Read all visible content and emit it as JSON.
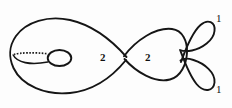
{
  "figure": {
    "kind": "mathematical-diagram",
    "stroke_color": "#151515",
    "background_color": "#ffffff",
    "components": [
      {
        "id": "left-lobe",
        "name": "left-large-loop",
        "multiplicity_label": "2",
        "has_handle": true,
        "handle_style": "dotted"
      },
      {
        "id": "right-lobe",
        "name": "right-loop",
        "multiplicity_label": "2",
        "has_handle": false
      },
      {
        "id": "top-tail",
        "name": "upper-small-loop",
        "multiplicity_label": "1",
        "has_handle": false
      },
      {
        "id": "bottom-tail",
        "name": "lower-small-loop",
        "multiplicity_label": "1",
        "has_handle": false
      }
    ],
    "labels": {
      "left_branch": "2",
      "right_branch": "2",
      "top_tail": "1",
      "bottom_tail": "1"
    },
    "node_points": [
      {
        "name": "central-crossing",
        "x": 125,
        "y": 58
      },
      {
        "name": "right-junction",
        "x": 186,
        "y": 55
      }
    ]
  }
}
